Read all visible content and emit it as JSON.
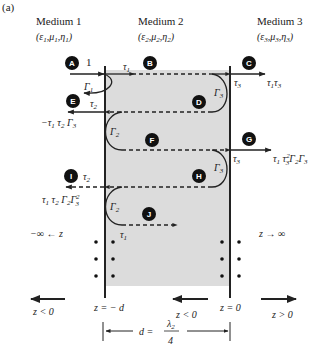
{
  "figure": {
    "panel_label": "(a)",
    "media": [
      {
        "name": "Medium 1",
        "params": "(ε1,μ1,η1)"
      },
      {
        "name": "Medium 2",
        "params": "(ε2,μ2,η2)"
      },
      {
        "name": "Medium 3",
        "params": "(ε3,μ3,η3)"
      }
    ],
    "points": [
      "A",
      "B",
      "C",
      "D",
      "E",
      "F",
      "G",
      "H",
      "I",
      "J"
    ],
    "labels": {
      "incident": "1",
      "gamma1": "Γ1",
      "gamma2": "Γ2",
      "gamma3": "Γ3",
      "tau1": "τ1",
      "tau2": "τ2",
      "tau3": "τ3",
      "out_C": "τ1 τ3",
      "out_E": "−τ1 τ2 Γ3",
      "out_G": "τ1 τ3² Γ2 Γ3",
      "out_I": "τ1 τ2 Γ2 Γ3²",
      "left_infinity": "−∞ ← z",
      "right_infinity": "z → ∞"
    },
    "axis": {
      "left_dir": "z < 0",
      "mid_dir": "z < 0",
      "right_dir": "z > 0",
      "left_boundary": "z = − d",
      "right_boundary": "z = 0",
      "thickness": "d =",
      "thickness_num": "λ2",
      "thickness_den": "4"
    },
    "colors": {
      "slab_fill": "#dcdcdc",
      "line": "#222222",
      "badge": "#111111"
    }
  }
}
